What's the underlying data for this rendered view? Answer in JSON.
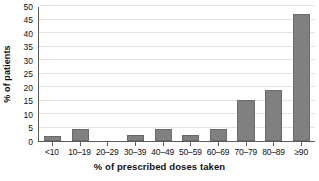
{
  "chart_data": {
    "type": "bar",
    "title": "",
    "xlabel": "% of prescribed doses taken",
    "ylabel": "% of patients",
    "categories": [
      "<10",
      "10–19",
      "20–29",
      "30–39",
      "40–49",
      "50–59",
      "60–69",
      "70–79",
      "80–89",
      "≥90"
    ],
    "values": [
      2,
      4.3,
      0,
      2.3,
      4.5,
      2.3,
      4.6,
      15.2,
      19,
      47
    ],
    "ylim": [
      0,
      50
    ],
    "y_ticks": [
      0,
      5,
      10,
      15,
      20,
      25,
      30,
      35,
      40,
      45,
      50
    ],
    "y_tick_labels": [
      "0",
      "5",
      "10",
      "15",
      "20",
      "25",
      "30",
      "35",
      "40",
      "45",
      "50"
    ],
    "grid": "horizontal",
    "legend": "none",
    "bar_color": "#808080",
    "bar_edge_color": "#6a6a6a",
    "grid_color": "#e2e2e2",
    "axis_color": "#5a5a5a",
    "background": "#ffffff"
  }
}
